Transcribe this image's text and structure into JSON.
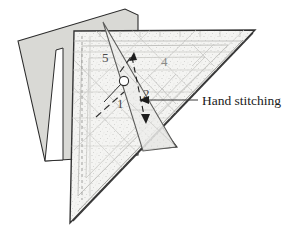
{
  "figure": {
    "background_color": "#ffffff",
    "callout": {
      "label": "Hand stitching",
      "leader_color": "#3a3a3a"
    },
    "pieces": [
      {
        "name": "backing-fabric-piece",
        "fill_color": "#d9d9d5",
        "stroke_color": "#2b2b2b"
      },
      {
        "name": "lower-fabric-tab",
        "fill_color": "#cfcfcb",
        "stroke_color": "#2b2b2b"
      },
      {
        "name": "main-triangle-template",
        "fill_color": "#f2f2f0",
        "stroke_color": "#333333"
      },
      {
        "name": "overlap-triangle-template",
        "fill_color": "#ededeb",
        "stroke_color": "#555555"
      }
    ],
    "section_labels": [
      {
        "id": "label-1",
        "text": "1",
        "x": 118,
        "y": 105
      },
      {
        "id": "label-2",
        "text": "2",
        "x": 144,
        "y": 95
      },
      {
        "id": "label-4",
        "text": "4",
        "x": 163,
        "y": 62
      },
      {
        "id": "label-5",
        "text": "5",
        "x": 102,
        "y": 58
      }
    ],
    "markers": {
      "pin_circle": {
        "name": "pin-circle",
        "cx": 124,
        "cy": 81,
        "r": 4.5
      },
      "dashed_arrow": {
        "name": "dashed-direction-arrow",
        "color": "#2f2f2f"
      },
      "stitch_arrow": {
        "name": "stitch-span-arrow",
        "color": "#1e1e1e"
      }
    }
  }
}
